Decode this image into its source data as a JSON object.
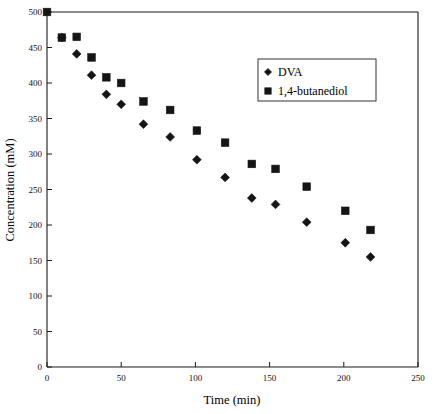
{
  "chart_data": {
    "type": "scatter",
    "title": "",
    "xlabel": "Time (min)",
    "ylabel": "Concentration (mM)",
    "xlim": [
      0,
      250
    ],
    "ylim": [
      0,
      500
    ],
    "xticks": [
      0,
      50,
      100,
      150,
      200,
      250
    ],
    "yticks": [
      0,
      50,
      100,
      150,
      200,
      250,
      300,
      350,
      400,
      450,
      500
    ],
    "grid": false,
    "legend_position": "upper-right-inset",
    "series": [
      {
        "name": "DVA",
        "marker": "diamond",
        "color": "#151515",
        "points": [
          [
            10,
            464
          ],
          [
            20,
            441
          ],
          [
            30,
            411
          ],
          [
            40,
            384
          ],
          [
            50,
            370
          ],
          [
            65,
            342
          ],
          [
            83,
            324
          ],
          [
            101,
            292
          ],
          [
            120,
            267
          ],
          [
            138,
            238
          ],
          [
            154,
            229
          ],
          [
            175,
            204
          ],
          [
            201,
            175
          ],
          [
            218,
            155
          ]
        ]
      },
      {
        "name": "1,4-butanediol",
        "marker": "square",
        "color": "#151515",
        "points": [
          [
            0,
            500
          ],
          [
            10,
            464
          ],
          [
            20,
            465
          ],
          [
            30,
            436
          ],
          [
            40,
            408
          ],
          [
            50,
            400
          ],
          [
            65,
            374
          ],
          [
            83,
            362
          ],
          [
            101,
            333
          ],
          [
            120,
            316
          ],
          [
            138,
            286
          ],
          [
            154,
            279
          ],
          [
            175,
            254
          ],
          [
            201,
            220
          ],
          [
            218,
            193
          ]
        ]
      }
    ]
  },
  "axes": {
    "x_title": "Time (min)",
    "y_title": "Concentration (mM)",
    "x_tick_labels": [
      "0",
      "50",
      "100",
      "150",
      "200",
      "250"
    ],
    "y_tick_labels": [
      "0",
      "50",
      "100",
      "150",
      "200",
      "250",
      "300",
      "350",
      "400",
      "450",
      "500"
    ]
  },
  "legend": {
    "entries": [
      {
        "label": "DVA",
        "marker": "diamond-marker-icon"
      },
      {
        "label": "1,4-butanediol",
        "marker": "square-marker-icon"
      }
    ]
  }
}
